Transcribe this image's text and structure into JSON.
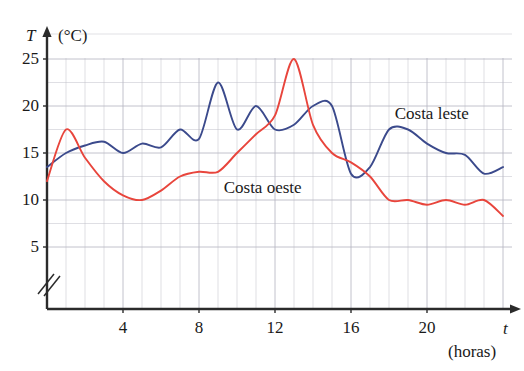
{
  "chart_data": {
    "type": "line",
    "title": "",
    "xlabel": "t",
    "xunit": "(horas)",
    "ylabel": "T",
    "yunit": "(°C)",
    "xlim": [
      0,
      24
    ],
    "ylim": [
      5,
      26.5
    ],
    "y_axis_break": true,
    "grid": true,
    "grid_x_step": 1,
    "grid_y_step": 2.5,
    "xticks": [
      4,
      8,
      12,
      16,
      20
    ],
    "yticks": [
      5,
      10,
      15,
      20,
      25
    ],
    "legend_position": "inline-annotation",
    "series": [
      {
        "name": "Costa leste",
        "color": "#3b4a8c",
        "x": [
          0,
          1,
          2,
          3,
          4,
          5,
          6,
          7,
          8,
          9,
          10,
          11,
          12,
          13,
          14,
          15,
          16,
          17,
          18,
          19,
          20,
          21,
          22,
          23,
          24
        ],
        "values": [
          13.5,
          15.0,
          15.8,
          16.2,
          15.0,
          16.0,
          15.6,
          17.5,
          16.5,
          22.5,
          17.5,
          20.0,
          17.5,
          18.0,
          20.0,
          20.0,
          12.8,
          13.5,
          17.5,
          17.5,
          16.0,
          15.0,
          14.8,
          12.8,
          13.5
        ]
      },
      {
        "name": "Costa oeste",
        "color": "#e8453c",
        "x": [
          0,
          1,
          2,
          3,
          4,
          5,
          6,
          7,
          8,
          9,
          10,
          11,
          12,
          13,
          14,
          15,
          16,
          17,
          18,
          19,
          20,
          21,
          22,
          23,
          24
        ],
        "values": [
          12.0,
          17.5,
          14.5,
          12.0,
          10.5,
          10.0,
          11.0,
          12.5,
          13.0,
          13.0,
          15.0,
          17.0,
          19.0,
          25.0,
          18.0,
          15.0,
          14.0,
          12.5,
          10.0,
          10.0,
          9.5,
          10.0,
          9.5,
          10.0,
          8.3
        ]
      }
    ],
    "annotations": [
      {
        "text": "Costa leste",
        "x": 18.3,
        "y": 19.2,
        "series": "Costa leste"
      },
      {
        "text": "Costa oeste",
        "x": 9.3,
        "y": 11.3,
        "series": "Costa oeste"
      }
    ]
  },
  "axes": {
    "y_name": "T",
    "y_unit": "(°C)",
    "x_name": "t",
    "x_unit": "(horas)",
    "y_tick_labels": [
      "25",
      "20",
      "15",
      "10",
      "5"
    ],
    "x_tick_labels": [
      "4",
      "8",
      "12",
      "16",
      "20"
    ]
  },
  "cropped_header": "",
  "colors": {
    "series_blue": "#3b4a8c",
    "series_red": "#e8453c",
    "grid": "#b9b9c4",
    "axis": "#2b2b2b",
    "text": "#1a1a1a"
  }
}
